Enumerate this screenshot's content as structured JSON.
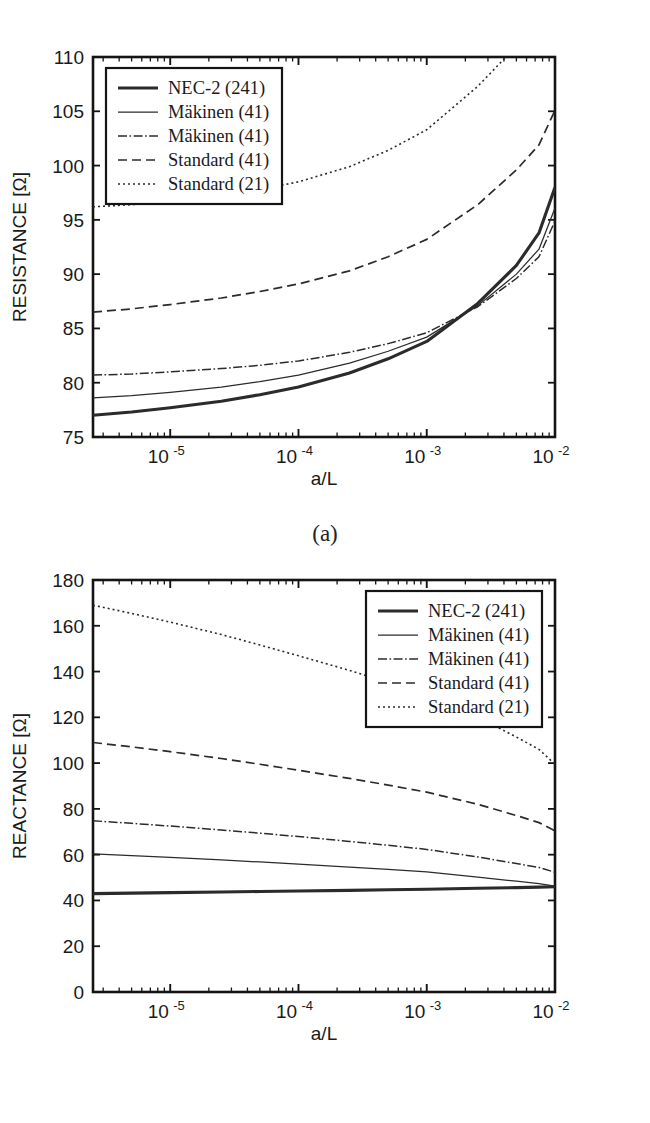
{
  "figure": {
    "panels": [
      {
        "id": "a",
        "caption": "(a)"
      },
      {
        "id": "b",
        "caption": "(b)"
      }
    ]
  },
  "chart_data": [
    {
      "type": "line",
      "panel": "(a)",
      "title": "",
      "xlabel": "a/L",
      "ylabel": "RESISTANCE [Ω]",
      "xscale": "log",
      "xlim": [
        2.5e-06,
        0.01
      ],
      "ylim": [
        75,
        110
      ],
      "yticks": [
        75,
        80,
        85,
        90,
        95,
        100,
        105,
        110
      ],
      "xticks": [
        1e-05,
        0.0001,
        0.001,
        0.01
      ],
      "xticklabels": [
        "10",
        "10",
        "10",
        "10"
      ],
      "xtickexponents": [
        "-5",
        "-4",
        "-3",
        "-2"
      ],
      "grid": false,
      "legend_position": "upper-left",
      "x": [
        2.5e-06,
        5e-06,
        1e-05,
        2.5e-05,
        5e-05,
        0.0001,
        0.00025,
        0.0005,
        0.001,
        0.0025,
        0.005,
        0.0075,
        0.01
      ],
      "series": [
        {
          "name": "NEC-2 (241)",
          "style": "thick-solid",
          "values": [
            77.0,
            77.3,
            77.7,
            78.3,
            78.9,
            79.6,
            80.9,
            82.2,
            83.8,
            87.3,
            90.8,
            93.8,
            98.0
          ]
        },
        {
          "name": "Mäkinen (41)",
          "style": "thin-solid",
          "values": [
            78.6,
            78.8,
            79.1,
            79.6,
            80.1,
            80.7,
            81.8,
            82.9,
            84.2,
            87.1,
            90.0,
            92.3,
            96.1
          ]
        },
        {
          "name": "Mäkinen (41)",
          "style": "dash-dot",
          "values": [
            80.7,
            80.8,
            81.0,
            81.3,
            81.6,
            82.0,
            82.8,
            83.6,
            84.6,
            87.0,
            89.6,
            91.6,
            94.9
          ]
        },
        {
          "name": "Standard (41)",
          "style": "dashed",
          "values": [
            86.5,
            86.8,
            87.2,
            87.8,
            88.4,
            89.1,
            90.3,
            91.6,
            93.2,
            96.4,
            99.6,
            101.9,
            105.1
          ]
        },
        {
          "name": "Standard (21)",
          "style": "dotted",
          "values": [
            96.2,
            96.4,
            96.7,
            97.2,
            97.8,
            98.5,
            99.9,
            101.4,
            103.3,
            107.3,
            111.0,
            113.6,
            117.0
          ]
        }
      ]
    },
    {
      "type": "line",
      "panel": "(b)",
      "title": "",
      "xlabel": "a/L",
      "ylabel": "REACTANCE [Ω]",
      "xscale": "log",
      "xlim": [
        2.5e-06,
        0.01
      ],
      "ylim": [
        0,
        180
      ],
      "yticks": [
        0,
        20,
        40,
        60,
        80,
        100,
        120,
        140,
        160,
        180
      ],
      "xticks": [
        1e-05,
        0.0001,
        0.001,
        0.01
      ],
      "xticklabels": [
        "10",
        "10",
        "10",
        "10"
      ],
      "xtickexponents": [
        "-5",
        "-4",
        "-3",
        "-2"
      ],
      "grid": false,
      "legend_position": "upper-right",
      "x": [
        2.5e-06,
        5e-06,
        1e-05,
        2.5e-05,
        5e-05,
        0.0001,
        0.00025,
        0.0005,
        0.001,
        0.0025,
        0.005,
        0.0075,
        0.01
      ],
      "series": [
        {
          "name": "NEC-2 (241)",
          "style": "thick-solid",
          "values": [
            43.0,
            43.2,
            43.4,
            43.7,
            43.9,
            44.1,
            44.4,
            44.7,
            44.9,
            45.3,
            45.6,
            45.8,
            46.0
          ]
        },
        {
          "name": "Mäkinen (41)",
          "style": "thin-solid",
          "values": [
            60.3,
            59.6,
            58.8,
            57.7,
            56.8,
            55.9,
            54.6,
            53.6,
            52.5,
            50.2,
            48.4,
            47.4,
            46.3
          ]
        },
        {
          "name": "Mäkinen (41)",
          "style": "dash-dot",
          "values": [
            74.8,
            73.7,
            72.5,
            70.8,
            69.4,
            67.9,
            65.8,
            64.1,
            62.3,
            59.0,
            56.1,
            54.4,
            52.3
          ]
        },
        {
          "name": "Standard (41)",
          "style": "dashed",
          "values": [
            109.0,
            107.1,
            105.0,
            102.0,
            99.5,
            96.9,
            93.3,
            90.4,
            87.3,
            82.0,
            77.1,
            74.0,
            70.4
          ]
        },
        {
          "name": "Standard (21)",
          "style": "dotted",
          "values": [
            169.0,
            165.4,
            161.6,
            156.2,
            151.6,
            146.9,
            140.5,
            135.2,
            129.6,
            120.1,
            111.4,
            106.0,
            99.5
          ]
        }
      ]
    }
  ],
  "legend": {
    "entries": [
      {
        "label": "NEC-2 (241)",
        "style": "thick-solid"
      },
      {
        "label": "Mäkinen (41)",
        "style": "thin-solid"
      },
      {
        "label": "Mäkinen (41)",
        "style": "dash-dot"
      },
      {
        "label": "Standard (41)",
        "style": "dashed"
      },
      {
        "label": "Standard (21)",
        "style": "dotted"
      }
    ]
  },
  "colors": {
    "line": "#2b2b2b",
    "axis": "#141414",
    "background": "#ffffff"
  }
}
